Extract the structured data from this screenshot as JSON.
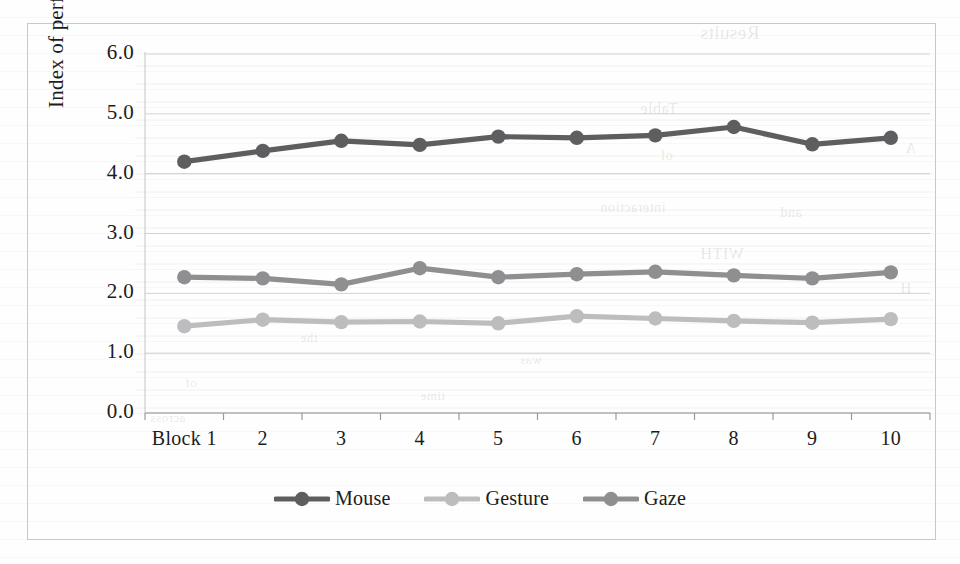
{
  "chart_data": {
    "type": "line",
    "title": "",
    "xlabel": "",
    "ylabel": "Index of performance",
    "categories": [
      "Block 1",
      "2",
      "3",
      "4",
      "5",
      "6",
      "7",
      "8",
      "9",
      "10"
    ],
    "ylim": [
      0.0,
      6.0
    ],
    "ytick_labels": [
      "0.0",
      "1.0",
      "2.0",
      "3.0",
      "4.0",
      "5.0",
      "6.0"
    ],
    "ytick_values": [
      0.0,
      1.0,
      2.0,
      3.0,
      4.0,
      5.0,
      6.0
    ],
    "grid": true,
    "legend_position": "bottom",
    "series": [
      {
        "name": "Mouse",
        "color": "#5e5e60",
        "values": [
          4.2,
          4.38,
          4.55,
          4.48,
          4.62,
          4.6,
          4.64,
          4.78,
          4.49,
          4.6
        ]
      },
      {
        "name": "Gesture",
        "color": "#bdbdbf",
        "values": [
          1.45,
          1.56,
          1.52,
          1.53,
          1.5,
          1.62,
          1.58,
          1.54,
          1.51,
          1.57
        ]
      },
      {
        "name": "Gaze",
        "color": "#8f8f92",
        "values": [
          2.27,
          2.25,
          2.15,
          2.42,
          2.27,
          2.32,
          2.36,
          2.3,
          2.25,
          2.35
        ]
      }
    ]
  },
  "scan_artifacts": {
    "bleed_text": [
      {
        "text": "Results",
        "x": 700,
        "y": 22,
        "size": 19
      },
      {
        "text": "Table",
        "x": 640,
        "y": 100,
        "size": 16
      },
      {
        "text": "A",
        "x": 905,
        "y": 140,
        "size": 15
      },
      {
        "text": "of",
        "x": 660,
        "y": 148,
        "size": 14
      },
      {
        "text": "interaction",
        "x": 600,
        "y": 200,
        "size": 14
      },
      {
        "text": "and",
        "x": 780,
        "y": 205,
        "size": 14
      },
      {
        "text": "WITH",
        "x": 700,
        "y": 245,
        "size": 16
      },
      {
        "text": "H",
        "x": 900,
        "y": 280,
        "size": 15
      },
      {
        "text": "the",
        "x": 300,
        "y": 330,
        "size": 13
      },
      {
        "text": "was",
        "x": 520,
        "y": 352,
        "size": 13
      },
      {
        "text": "of",
        "x": 185,
        "y": 375,
        "size": 13
      },
      {
        "text": "time",
        "x": 420,
        "y": 388,
        "size": 13
      },
      {
        "text": "across",
        "x": 150,
        "y": 410,
        "size": 13
      }
    ]
  }
}
